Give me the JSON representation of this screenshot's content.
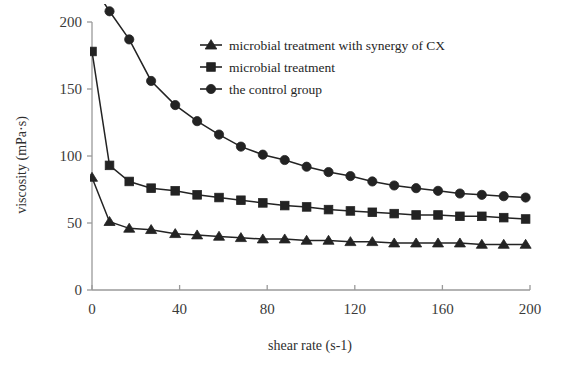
{
  "chart_data": {
    "type": "line",
    "title": "",
    "xlabel": "shear rate (s-1)",
    "ylabel": "viscosity (mPa·s)",
    "xlim": [
      0,
      200
    ],
    "ylim": [
      0,
      200
    ],
    "xticks": [
      0,
      40,
      80,
      120,
      160,
      200
    ],
    "yticks": [
      0,
      50,
      100,
      150,
      200
    ],
    "grid": false,
    "legend_position": "top-right",
    "x": [
      0,
      8,
      17,
      27,
      38,
      48,
      58,
      68,
      78,
      88,
      98,
      108,
      118,
      128,
      138,
      148,
      158,
      168,
      178,
      188,
      198
    ],
    "series": [
      {
        "name": "microbial treatment with synergy of CX",
        "marker": "triangle",
        "values": [
          84,
          51,
          46,
          45,
          42,
          41,
          40,
          39,
          38,
          38,
          37,
          37,
          36,
          36,
          35,
          35,
          35,
          35,
          34,
          34,
          34
        ]
      },
      {
        "name": "microbial treatment",
        "marker": "square",
        "values": [
          178,
          93,
          81,
          76,
          74,
          71,
          69,
          67,
          65,
          63,
          62,
          60,
          59,
          58,
          57,
          56,
          56,
          55,
          55,
          54,
          53
        ]
      },
      {
        "name": "the control group",
        "marker": "circle",
        "values": [
          228,
          208,
          187,
          156,
          138,
          126,
          116,
          107,
          101,
          97,
          92,
          88,
          85,
          81,
          78,
          76,
          74,
          72,
          71,
          70,
          69
        ]
      }
    ]
  },
  "axes": {
    "x_tick_labels": [
      "0",
      "40",
      "80",
      "120",
      "160",
      "200"
    ],
    "y_tick_labels": [
      "0",
      "50",
      "100",
      "150",
      "200"
    ],
    "x_axis_title": "shear rate (s-1)",
    "y_axis_title": "viscosity (mPa·s)"
  },
  "legend": {
    "entries": [
      {
        "label": "microbial treatment with synergy of CX",
        "marker": "triangle-marker"
      },
      {
        "label": "microbial treatment",
        "marker": "square-marker"
      },
      {
        "label": "the control group",
        "marker": "circle-marker"
      }
    ]
  },
  "style": {
    "series_color": "#232323",
    "axis_color": "#9a9a9a",
    "background": "#ffffff"
  }
}
